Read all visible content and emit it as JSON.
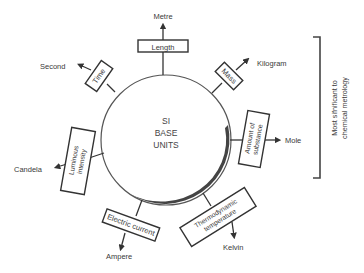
{
  "diagram": {
    "center": {
      "line1": "SI",
      "line2": "BASE",
      "line3": "UNITS"
    },
    "quantities": [
      {
        "id": "length",
        "quantity": "Length",
        "unit": "Metre"
      },
      {
        "id": "mass",
        "quantity": "Mass",
        "unit": "Kilogram"
      },
      {
        "id": "amount",
        "quantity_line1": "Amount of",
        "quantity_line2": "substance",
        "unit": "Mole"
      },
      {
        "id": "temperature",
        "quantity_line1": "Thermodynamic",
        "quantity_line2": "temperature",
        "unit": "Kelvin"
      },
      {
        "id": "current",
        "quantity": "Electric current",
        "unit": "Ampere"
      },
      {
        "id": "luminous",
        "quantity_line1": "Luminous",
        "quantity_line2": "intensity",
        "unit": "Candela"
      },
      {
        "id": "time",
        "quantity": "Time",
        "unit": "Second"
      }
    ],
    "bracket_note": {
      "line1": "Most sifnificant to",
      "line2": "chemical metrology"
    },
    "colors": {
      "stroke": "#333333",
      "text": "#3a3a3a",
      "background": "#ffffff"
    }
  }
}
